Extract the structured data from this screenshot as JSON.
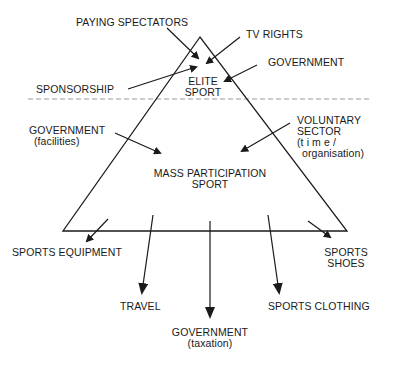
{
  "diagram": {
    "top_section": {
      "label_line1": "ELITE",
      "label_line2": "SPORT",
      "inflows": [
        {
          "label": "PAYING SPECTATORS"
        },
        {
          "label": "TV RIGHTS"
        },
        {
          "label": "GOVERNMENT"
        },
        {
          "label": "SPONSORSHIP"
        }
      ]
    },
    "bottom_section": {
      "label_line1": "MASS PARTICIPATION",
      "label_line2": "SPORT",
      "inflows": [
        {
          "label": "GOVERNMENT",
          "sub": "(facilities)"
        },
        {
          "label_line1": "VOLUNTARY",
          "label_line2": "SECTOR",
          "sub_line1": "(t i m e /",
          "sub_line2": "organisation)"
        }
      ],
      "outflows": [
        {
          "label": "SPORTS EQUIPMENT"
        },
        {
          "label": "TRAVEL"
        },
        {
          "label": "GOVERNMENT",
          "sub": "(taxation)"
        },
        {
          "label": "SPORTS CLOTHING"
        },
        {
          "label_line1": "SPORTS",
          "label_line2": "SHOES"
        }
      ]
    },
    "divider": "dashed",
    "colors": {
      "line": "#1a1a1a",
      "divider": "#9a9a9a",
      "background": "#ffffff"
    }
  }
}
